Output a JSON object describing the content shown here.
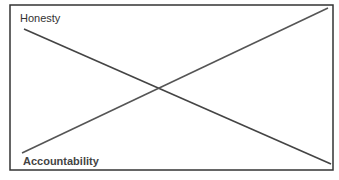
{
  "diagram": {
    "type": "crossing-lines",
    "labels": {
      "top_left": "Honesty",
      "bottom_left": "Accountability"
    },
    "colors": {
      "border": "#333333",
      "line": "#444444",
      "text": "#333333",
      "background": "#ffffff"
    },
    "lines": [
      {
        "name": "honesty-line",
        "from": [
          24,
          29
        ],
        "to": [
          331,
          164
        ]
      },
      {
        "name": "accountability-line",
        "from": [
          22,
          153
        ],
        "to": [
          328,
          8
        ]
      }
    ]
  }
}
